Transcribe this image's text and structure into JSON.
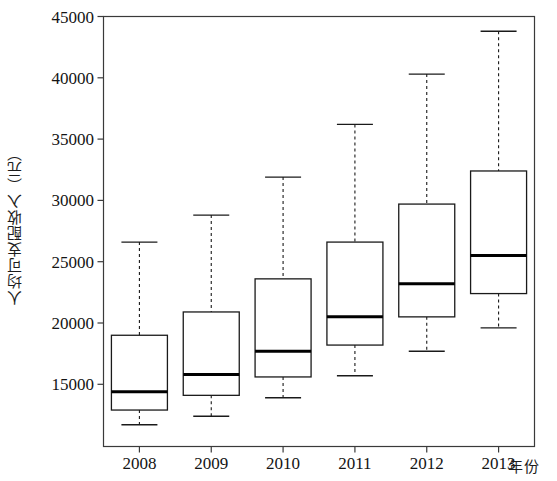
{
  "chart_data": {
    "type": "box",
    "title": "",
    "xlabel": "年份",
    "ylabel": "人均可支配收入（元）",
    "categories": [
      "2008",
      "2009",
      "2010",
      "2011",
      "2012",
      "2013"
    ],
    "ylim": [
      11000,
      45000
    ],
    "yticks": [
      15000,
      20000,
      25000,
      30000,
      35000,
      40000,
      45000
    ],
    "ytick_labels": [
      "15000",
      "20000",
      "25000",
      "30000",
      "35000",
      "40000",
      "45000"
    ],
    "grid": false,
    "legend": null,
    "box_color": "#ffffff",
    "edge_color": "#1a1a1a",
    "median_color": "#000000",
    "whisker_style": "dashed",
    "boxes": [
      {
        "category": "2008",
        "whisker_low": 11700,
        "q1": 12900,
        "median": 14400,
        "q3": 19000,
        "whisker_high": 26600
      },
      {
        "category": "2009",
        "whisker_low": 12400,
        "q1": 14100,
        "median": 15800,
        "q3": 20900,
        "whisker_high": 28800
      },
      {
        "category": "2010",
        "whisker_low": 13900,
        "q1": 15600,
        "median": 17700,
        "q3": 23600,
        "whisker_high": 31900
      },
      {
        "category": "2011",
        "whisker_low": 15700,
        "q1": 18200,
        "median": 20500,
        "q3": 26600,
        "whisker_high": 36200
      },
      {
        "category": "2012",
        "whisker_low": 17700,
        "q1": 20500,
        "median": 23200,
        "q3": 29700,
        "whisker_high": 40300
      },
      {
        "category": "2013",
        "whisker_low": 19600,
        "q1": 22400,
        "median": 25500,
        "q3": 32400,
        "whisker_high": 43800
      }
    ]
  },
  "axes": {
    "y_axis_title": "人均可支配收入（元）",
    "x_axis_title": "年份"
  }
}
